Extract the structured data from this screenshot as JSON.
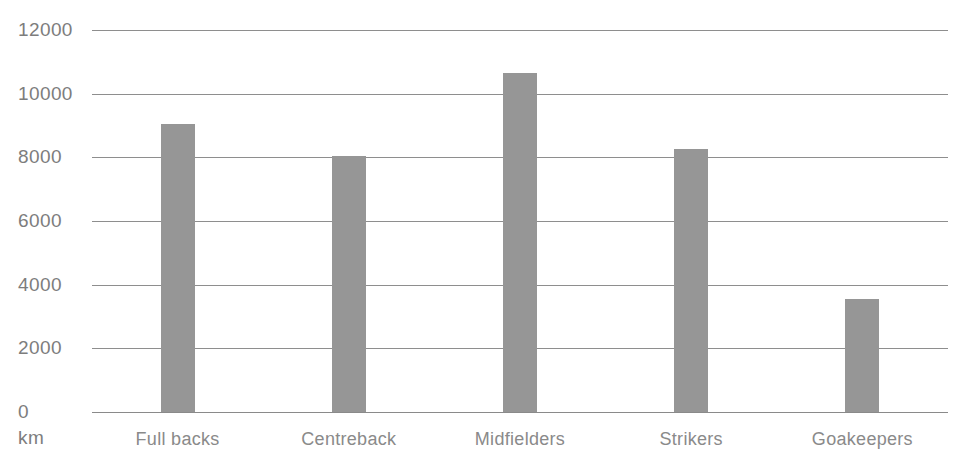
{
  "chart_data": {
    "type": "bar",
    "title": "",
    "subtitle": "",
    "xlabel": "",
    "ylabel": "km",
    "categories": [
      "Full backs",
      "Centreback",
      "Midfielders",
      "Strikers",
      "Goakeepers"
    ],
    "values": [
      9050,
      8050,
      10650,
      8250,
      3550
    ],
    "ylim": [
      0,
      12000
    ],
    "ytick_labels": [
      "12000",
      "10000",
      "8000",
      "6000",
      "4000",
      "2000",
      "0"
    ],
    "ytick_values": [
      12000,
      10000,
      8000,
      6000,
      4000,
      2000,
      0
    ],
    "grid": true,
    "legend": "none",
    "bar_color": "#969696",
    "grid_color": "#8e8e8e",
    "text_color": "#7d7d7d",
    "background_color": "#ffffff"
  },
  "axis": {
    "unit_label": "km",
    "ticks": [
      {
        "label": "12000",
        "value": 12000
      },
      {
        "label": "10000",
        "value": 10000
      },
      {
        "label": "8000",
        "value": 8000
      },
      {
        "label": "6000",
        "value": 6000
      },
      {
        "label": "4000",
        "value": 4000
      },
      {
        "label": "2000",
        "value": 2000
      },
      {
        "label": "0",
        "value": 0
      }
    ]
  },
  "bars": [
    {
      "label": "Full backs",
      "value": 9050
    },
    {
      "label": "Centreback",
      "value": 8050
    },
    {
      "label": "Midfielders",
      "value": 10650
    },
    {
      "label": "Strikers",
      "value": 8250
    },
    {
      "label": "Goakeepers",
      "value": 3550
    }
  ]
}
